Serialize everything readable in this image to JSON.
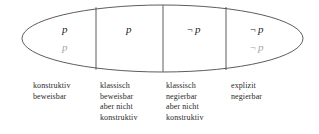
{
  "figure": {
    "shape": "ellipse-divided-in-four-regions",
    "stroke_color": "#4a4a4a",
    "primary_text_color": "#1f1f1f",
    "secondary_text_color": "#a6a6a6",
    "background": "#ffffff"
  },
  "cells": [
    {
      "id": "cell-1",
      "primary": "p",
      "secondary": "p",
      "caption": [
        "konstruktiv",
        "beweisbar"
      ]
    },
    {
      "id": "cell-2",
      "primary": "p",
      "secondary": "",
      "caption": [
        "klassisch",
        "beweisbar",
        "aber nicht",
        "konstruktiv"
      ]
    },
    {
      "id": "cell-3",
      "primary": "¬ p",
      "secondary": "",
      "caption": [
        "klassisch",
        "negierbar",
        "aber nicht",
        "konstruktiv"
      ]
    },
    {
      "id": "cell-4",
      "primary": "¬ p",
      "secondary": "¬ p",
      "caption": [
        "explizit",
        "negierbar"
      ]
    }
  ],
  "cell_text": {
    "c1_primary": "p",
    "c1_secondary": "p",
    "c2_primary": "p",
    "c3_primary_neg": "¬",
    "c3_primary_var": "p",
    "c4_primary_neg": "¬",
    "c4_primary_var": "p",
    "c4_secondary_neg": "¬",
    "c4_secondary_var": "p"
  },
  "captions": {
    "col1": {
      "l1": "konstruktiv",
      "l2": "beweisbar"
    },
    "col2": {
      "l1": "klassisch",
      "l2": "beweisbar",
      "l3": "aber nicht",
      "l4": "konstruktiv"
    },
    "col3": {
      "l1": "klassisch",
      "l2": "negierbar",
      "l3": "aber nicht",
      "l4": "konstruktiv"
    },
    "col4": {
      "l1": "explizit",
      "l2": "negierbar"
    }
  }
}
